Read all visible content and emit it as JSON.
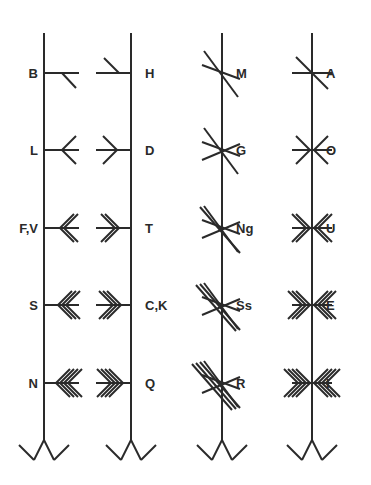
{
  "columns": [
    {
      "name": "aicme-beithe",
      "side": "left",
      "letters": [
        "B",
        "L",
        "F,V",
        "S",
        "N"
      ]
    },
    {
      "name": "aicme-huatha",
      "side": "right",
      "letters": [
        "H",
        "D",
        "T",
        "C,K",
        "Q"
      ]
    },
    {
      "name": "aicme-muine",
      "side": "diagonal",
      "letters": [
        "M",
        "G",
        "Ng",
        "Ss",
        "R"
      ]
    },
    {
      "name": "aicme-ailme",
      "side": "across",
      "letters": [
        "A",
        "O",
        "U",
        "E",
        "I"
      ]
    }
  ],
  "stroke_color": "#2a2a2a"
}
